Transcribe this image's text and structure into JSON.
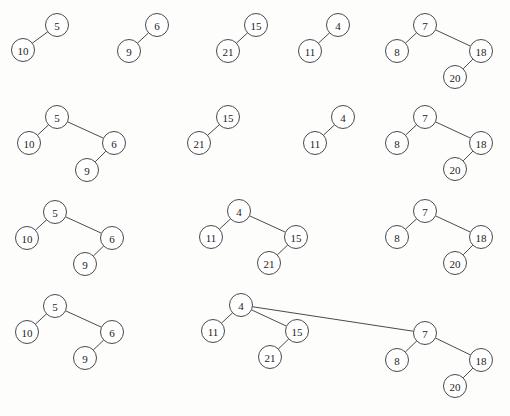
{
  "canvas": {
    "width": 510,
    "height": 416,
    "background": "#fdfdfc",
    "node_radius": 11.5,
    "node_fill": "#ffffff",
    "node_stroke": "#4a4a4a",
    "edge_stroke": "#4a4a4a",
    "label_color": "#1c1c1c"
  },
  "rows": [
    {
      "name": "row-1",
      "trees": [
        {
          "name": "tree-5",
          "nodes": [
            {
              "id": "r1t1n5",
              "label": "5",
              "x": 57,
              "y": 25
            },
            {
              "id": "r1t1n10",
              "label": "10",
              "x": 23,
              "y": 50
            }
          ],
          "edges": [
            [
              "r1t1n5",
              "r1t1n10"
            ]
          ]
        },
        {
          "name": "tree-6",
          "nodes": [
            {
              "id": "r1t2n6",
              "label": "6",
              "x": 157,
              "y": 25
            },
            {
              "id": "r1t2n9",
              "label": "9",
              "x": 129,
              "y": 51
            }
          ],
          "edges": [
            [
              "r1t2n6",
              "r1t2n9"
            ]
          ]
        },
        {
          "name": "tree-15",
          "nodes": [
            {
              "id": "r1t3n15",
              "label": "15",
              "x": 256,
              "y": 25
            },
            {
              "id": "r1t3n21",
              "label": "21",
              "x": 228,
              "y": 51
            }
          ],
          "edges": [
            [
              "r1t3n15",
              "r1t3n21"
            ]
          ]
        },
        {
          "name": "tree-4",
          "nodes": [
            {
              "id": "r1t4n4",
              "label": "4",
              "x": 338,
              "y": 25
            },
            {
              "id": "r1t4n11",
              "label": "11",
              "x": 310,
              "y": 51
            }
          ],
          "edges": [
            [
              "r1t4n4",
              "r1t4n11"
            ]
          ]
        },
        {
          "name": "tree-7",
          "nodes": [
            {
              "id": "r1t5n7",
              "label": "7",
              "x": 425,
              "y": 25
            },
            {
              "id": "r1t5n8",
              "label": "8",
              "x": 397,
              "y": 51
            },
            {
              "id": "r1t5n18",
              "label": "18",
              "x": 481,
              "y": 51
            },
            {
              "id": "r1t5n20",
              "label": "20",
              "x": 455,
              "y": 77
            }
          ],
          "edges": [
            [
              "r1t5n7",
              "r1t5n8"
            ],
            [
              "r1t5n7",
              "r1t5n18"
            ],
            [
              "r1t5n18",
              "r1t5n20"
            ]
          ]
        }
      ]
    },
    {
      "name": "row-2",
      "trees": [
        {
          "name": "tree-5",
          "nodes": [
            {
              "id": "r2t1n5",
              "label": "5",
              "x": 57,
              "y": 117
            },
            {
              "id": "r2t1n10",
              "label": "10",
              "x": 29,
              "y": 143
            },
            {
              "id": "r2t1n6",
              "label": "6",
              "x": 114,
              "y": 143
            },
            {
              "id": "r2t1n9",
              "label": "9",
              "x": 87,
              "y": 170
            }
          ],
          "edges": [
            [
              "r2t1n5",
              "r2t1n10"
            ],
            [
              "r2t1n5",
              "r2t1n6"
            ],
            [
              "r2t1n6",
              "r2t1n9"
            ]
          ]
        },
        {
          "name": "tree-15",
          "nodes": [
            {
              "id": "r2t2n15",
              "label": "15",
              "x": 228,
              "y": 117
            },
            {
              "id": "r2t2n21",
              "label": "21",
              "x": 199,
              "y": 143
            }
          ],
          "edges": [
            [
              "r2t2n15",
              "r2t2n21"
            ]
          ]
        },
        {
          "name": "tree-4",
          "nodes": [
            {
              "id": "r2t3n4",
              "label": "4",
              "x": 343,
              "y": 117
            },
            {
              "id": "r2t3n11",
              "label": "11",
              "x": 315,
              "y": 143
            }
          ],
          "edges": [
            [
              "r2t3n4",
              "r2t3n11"
            ]
          ]
        },
        {
          "name": "tree-7",
          "nodes": [
            {
              "id": "r2t4n7",
              "label": "7",
              "x": 425,
              "y": 117
            },
            {
              "id": "r2t4n8",
              "label": "8",
              "x": 397,
              "y": 143
            },
            {
              "id": "r2t4n18",
              "label": "18",
              "x": 481,
              "y": 143
            },
            {
              "id": "r2t4n20",
              "label": "20",
              "x": 455,
              "y": 169
            }
          ],
          "edges": [
            [
              "r2t4n7",
              "r2t4n8"
            ],
            [
              "r2t4n7",
              "r2t4n18"
            ],
            [
              "r2t4n18",
              "r2t4n20"
            ]
          ]
        }
      ]
    },
    {
      "name": "row-3",
      "trees": [
        {
          "name": "tree-5",
          "nodes": [
            {
              "id": "r3t1n5",
              "label": "5",
              "x": 55,
              "y": 212
            },
            {
              "id": "r3t1n10",
              "label": "10",
              "x": 27,
              "y": 238
            },
            {
              "id": "r3t1n6",
              "label": "6",
              "x": 112,
              "y": 238
            },
            {
              "id": "r3t1n9",
              "label": "9",
              "x": 85,
              "y": 264
            }
          ],
          "edges": [
            [
              "r3t1n5",
              "r3t1n10"
            ],
            [
              "r3t1n5",
              "r3t1n6"
            ],
            [
              "r3t1n6",
              "r3t1n9"
            ]
          ]
        },
        {
          "name": "tree-4",
          "nodes": [
            {
              "id": "r3t2n4",
              "label": "4",
              "x": 239,
              "y": 211
            },
            {
              "id": "r3t2n11",
              "label": "11",
              "x": 211,
              "y": 237
            },
            {
              "id": "r3t2n15",
              "label": "15",
              "x": 296,
              "y": 237
            },
            {
              "id": "r3t2n21",
              "label": "21",
              "x": 269,
              "y": 263
            }
          ],
          "edges": [
            [
              "r3t2n4",
              "r3t2n11"
            ],
            [
              "r3t2n4",
              "r3t2n15"
            ],
            [
              "r3t2n15",
              "r3t2n21"
            ]
          ]
        },
        {
          "name": "tree-7",
          "nodes": [
            {
              "id": "r3t3n7",
              "label": "7",
              "x": 425,
              "y": 211
            },
            {
              "id": "r3t3n8",
              "label": "8",
              "x": 397,
              "y": 237
            },
            {
              "id": "r3t3n18",
              "label": "18",
              "x": 481,
              "y": 237
            },
            {
              "id": "r3t3n20",
              "label": "20",
              "x": 455,
              "y": 263
            }
          ],
          "edges": [
            [
              "r3t3n7",
              "r3t3n8"
            ],
            [
              "r3t3n7",
              "r3t3n18"
            ],
            [
              "r3t3n18",
              "r3t3n20"
            ]
          ]
        }
      ]
    },
    {
      "name": "row-4",
      "trees": [
        {
          "name": "tree-5",
          "nodes": [
            {
              "id": "r4t1n5",
              "label": "5",
              "x": 55,
              "y": 306
            },
            {
              "id": "r4t1n10",
              "label": "10",
              "x": 27,
              "y": 332
            },
            {
              "id": "r4t1n6",
              "label": "6",
              "x": 112,
              "y": 332
            },
            {
              "id": "r4t1n9",
              "label": "9",
              "x": 85,
              "y": 358
            }
          ],
          "edges": [
            [
              "r4t1n5",
              "r4t1n10"
            ],
            [
              "r4t1n5",
              "r4t1n6"
            ],
            [
              "r4t1n6",
              "r4t1n9"
            ]
          ]
        },
        {
          "name": "tree-4-merged",
          "nodes": [
            {
              "id": "r4t2n4",
              "label": "4",
              "x": 241,
              "y": 305
            },
            {
              "id": "r4t2n11",
              "label": "11",
              "x": 213,
              "y": 331
            },
            {
              "id": "r4t2n15",
              "label": "15",
              "x": 297,
              "y": 331
            },
            {
              "id": "r4t2n21",
              "label": "21",
              "x": 270,
              "y": 357
            },
            {
              "id": "r4t2n7",
              "label": "7",
              "x": 425,
              "y": 333
            },
            {
              "id": "r4t2n8",
              "label": "8",
              "x": 397,
              "y": 360
            },
            {
              "id": "r4t2n18",
              "label": "18",
              "x": 481,
              "y": 360
            },
            {
              "id": "r4t2n20",
              "label": "20",
              "x": 455,
              "y": 386
            }
          ],
          "edges": [
            [
              "r4t2n4",
              "r4t2n11"
            ],
            [
              "r4t2n4",
              "r4t2n15"
            ],
            [
              "r4t2n15",
              "r4t2n21"
            ],
            [
              "r4t2n4",
              "r4t2n7"
            ],
            [
              "r4t2n7",
              "r4t2n8"
            ],
            [
              "r4t2n7",
              "r4t2n18"
            ],
            [
              "r4t2n18",
              "r4t2n20"
            ]
          ]
        }
      ]
    }
  ]
}
